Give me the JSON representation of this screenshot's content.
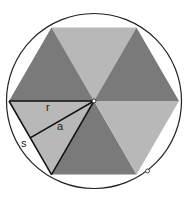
{
  "diagram": {
    "labels": {
      "radius": "r",
      "apothem": "a",
      "side": "s"
    },
    "colors": {
      "dark_triangle": "#7a7a7a",
      "light_triangle": "#b8b8b8",
      "circle_stroke": "#222222",
      "line_stroke": "#111111",
      "background": "#ffffff"
    }
  }
}
